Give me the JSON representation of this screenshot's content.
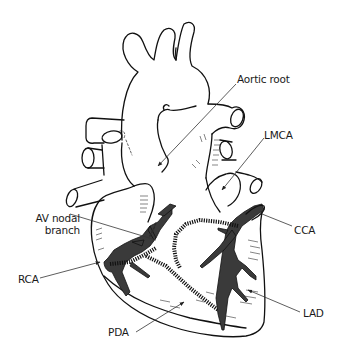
{
  "figure": {
    "colors": {
      "background": "#ffffff",
      "outline": "#111111",
      "vessel_fill": "#3a3a3a",
      "label_text": "#1a1a1a"
    }
  },
  "labels": {
    "aortic_root": "Aortic root",
    "lmca": "LMCA",
    "av_nodal_line1": "AV nodal",
    "av_nodal_line2": "branch",
    "cca": "CCA",
    "rca": "RCA",
    "lad": "LAD",
    "pda": "PDA"
  }
}
